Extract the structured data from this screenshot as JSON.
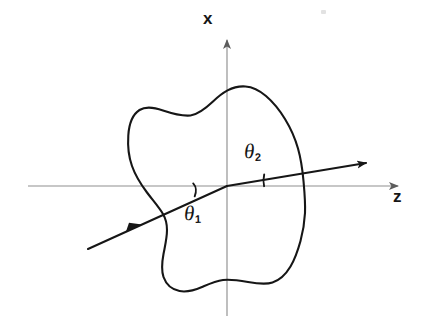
{
  "figure": {
    "kind": "physics-diagram",
    "background_color": "#ffffff",
    "ink_color": "#161616",
    "axis_color": "#8f8f8f"
  },
  "axes": {
    "vertical": {
      "label": "x",
      "x": 227,
      "y_top": 32,
      "y_bottom": 316,
      "arrow": "up"
    },
    "horizontal": {
      "label": "z",
      "y": 186,
      "x_left": 28,
      "x_right": 406,
      "arrow": "right"
    },
    "origin": {
      "x": 227,
      "y": 186
    }
  },
  "angles": [
    {
      "name": "theta-1",
      "symbol": "θ",
      "subscript": "1",
      "label_x": 184,
      "label_y": 203,
      "tick_marker": {
        "x": 194,
        "y_top": 183,
        "y_bottom": 196
      }
    },
    {
      "name": "theta-2",
      "symbol": "θ",
      "subscript": "2",
      "label_x": 244,
      "label_y": 141,
      "tick_marker": {
        "x": 264,
        "y_top": 174,
        "y_bottom": 186
      }
    }
  ],
  "rays": {
    "incident": {
      "start": {
        "x": 88,
        "y": 249
      },
      "end": {
        "x": 227,
        "y": 186
      },
      "arrowhead": {
        "x": 139,
        "y": 226
      },
      "boundary_crossing": {
        "x": 163,
        "y": 214
      }
    },
    "refracted": {
      "start": {
        "x": 227,
        "y": 186
      },
      "end": {
        "x": 374,
        "y": 161
      },
      "arrowhead": {
        "x": 372,
        "y": 162
      },
      "boundary_crossing": {
        "x": 301,
        "y": 173
      }
    }
  },
  "blob": {
    "name": "medium-boundary",
    "leftmost": {
      "x": 128,
      "y": 155
    },
    "rightmost": {
      "x": 305,
      "y": 181
    },
    "topmost": {
      "x": 245,
      "y": 86
    },
    "bottommost": {
      "x": 186,
      "y": 291
    },
    "path": "M 245.5 86.5 C 232 85.5 222 93 213 101.5 C 205 109 198 114.5 190.5 115.5 C 181 116.5 172 113.5 163 110.5 C 154.5 107.5 146 106 139.5 110 C 132.5 114.5 129 124.5 128.3 135.5 C 127.6 146 128.6 156.5 132 166 C 135.5 176 141 184.5 147 192.5 C 153 200.5 159.5 208 163 214 C 166.5 220 167 224 167 230 C 167 238 165 246 163.5 254 C 162 262 161 269.5 163.5 277 C 166 284 172 289.5 179.5 291 C 187 292.5 195 290 202 287 C 209 284 215.5 281 223 280 C 231 279 239.5 280.5 248 282 C 256.5 283.5 265 285 272.5 282.5 C 280 280 286 274 290.5 266.5 C 295 259 298 250 300.5 241 C 303 232 304.5 222.5 305 213 C 305.5 202.5 304.5 192 303.5 181 C 302.5 170 301 159 298 148.5 C 295 138 290.5 128 285 119 C 279.5 110 273 102 266 96 C 259.5 90.5 253 87 245.5 86.5 Z"
  },
  "artifact": {
    "name": "scan-speck",
    "x": 321,
    "y": 10
  }
}
